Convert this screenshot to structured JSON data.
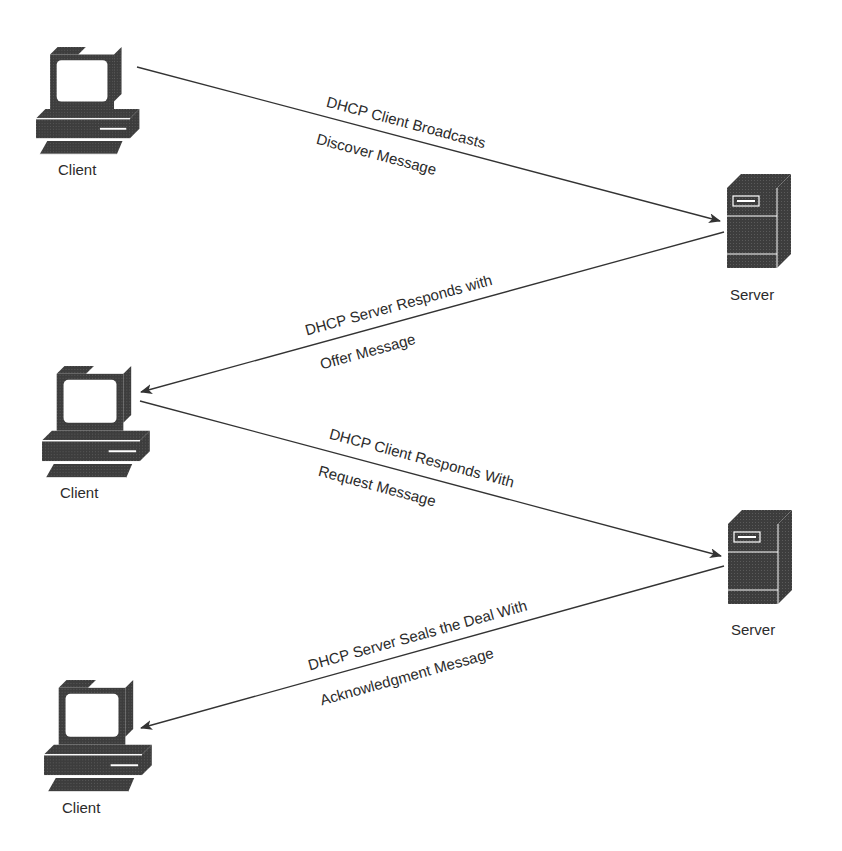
{
  "diagram": {
    "colors": {
      "device": "#4a4a4a",
      "device_dark": "#333333",
      "line": "#333333",
      "background": "#ffffff"
    },
    "nodes": [
      {
        "id": "client1",
        "type": "client",
        "label": "Client"
      },
      {
        "id": "server1",
        "type": "server",
        "label": "Server"
      },
      {
        "id": "client2",
        "type": "client",
        "label": "Client"
      },
      {
        "id": "server2",
        "type": "server",
        "label": "Server"
      },
      {
        "id": "client3",
        "type": "client",
        "label": "Client"
      }
    ],
    "messages": [
      {
        "from": "client1",
        "to": "server1",
        "line1": "DHCP Client Broadcasts",
        "line2": "Discover Message"
      },
      {
        "from": "server1",
        "to": "client2",
        "line1": "DHCP Server Responds with",
        "line2": "Offer Message"
      },
      {
        "from": "client2",
        "to": "server2",
        "line1": "DHCP Client Responds With",
        "line2": "Request Message"
      },
      {
        "from": "server2",
        "to": "client3",
        "line1": "DHCP Server Seals the Deal With",
        "line2": "Acknowledgment Message"
      }
    ]
  }
}
